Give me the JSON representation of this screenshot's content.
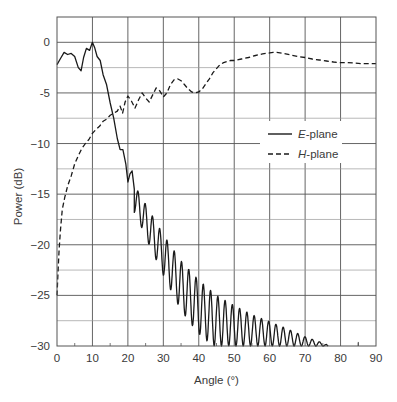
{
  "chart_data": {
    "type": "line",
    "title": "",
    "xlabel": "Angle (°)",
    "ylabel": "Power (dB)",
    "xlim": [
      0,
      90
    ],
    "ylim": [
      -30,
      2.5
    ],
    "x_ticks": [
      0,
      10,
      20,
      30,
      40,
      50,
      60,
      70,
      80,
      90
    ],
    "y_ticks": [
      0,
      -5,
      -10,
      -15,
      -20,
      -25,
      -30
    ],
    "y_tick_labels": [
      "0",
      "-5",
      "−10",
      "−15",
      "−20",
      "−25",
      "−30"
    ],
    "grid": true,
    "minor_grid_y": [
      2.5,
      -2.5,
      -7.5,
      -12.5,
      -17.5,
      -22.5,
      -27.5
    ],
    "legend": {
      "position": "right-middle",
      "entries": [
        {
          "label_italic": "E",
          "label_rest": "-plane",
          "style": "solid"
        },
        {
          "label_italic": "H",
          "label_rest": "-plane",
          "style": "dashed"
        }
      ]
    },
    "series": [
      {
        "name": "E-plane",
        "style": "solid",
        "color": "#1a1a1a",
        "main_lobe": [
          [
            0,
            -2.2
          ],
          [
            1,
            -1.6
          ],
          [
            2,
            -1.0
          ],
          [
            3,
            -1.2
          ],
          [
            4,
            -1.1
          ],
          [
            5,
            -1.4
          ],
          [
            6,
            -2.5
          ],
          [
            6.8,
            -2.8
          ],
          [
            7.5,
            -1.5
          ],
          [
            8.3,
            -0.6
          ],
          [
            9.2,
            -0.8
          ],
          [
            10,
            0.0
          ],
          [
            10.6,
            -0.5
          ],
          [
            11.3,
            -1.4
          ],
          [
            12.2,
            -1.8
          ],
          [
            13,
            -3.2
          ],
          [
            14,
            -4.2
          ],
          [
            15,
            -6.0
          ],
          [
            16,
            -7.5
          ],
          [
            17,
            -9.5
          ],
          [
            17.8,
            -10.6
          ],
          [
            18.6,
            -10.6
          ],
          [
            19.4,
            -12.0
          ],
          [
            20,
            -13.8
          ],
          [
            20.6,
            -13.0
          ],
          [
            21.2,
            -12.7
          ],
          [
            21.8,
            -14.5
          ]
        ],
        "sidelobe_ripple": {
          "start_angle": 21.8,
          "end_angle": 76,
          "period_deg": 2.05,
          "peak_envelope": [
            [
              22,
              -14.2
            ],
            [
              25,
              -16.0
            ],
            [
              30,
              -19.0
            ],
            [
              35,
              -21.6
            ],
            [
              40,
              -23.5
            ],
            [
              45,
              -25.0
            ],
            [
              50,
              -26.0
            ],
            [
              55,
              -26.9
            ],
            [
              60,
              -27.6
            ],
            [
              65,
              -28.3
            ],
            [
              70,
              -29.1
            ],
            [
              75,
              -29.7
            ],
            [
              76,
              -29.85
            ]
          ],
          "trough_envelope": [
            [
              22,
              -16.8
            ],
            [
              26,
              -20.0
            ],
            [
              30,
              -23.0
            ],
            [
              35,
              -26.5
            ],
            [
              40,
              -28.8
            ],
            [
              44,
              -30
            ],
            [
              90,
              -30
            ]
          ]
        }
      },
      {
        "name": "H-plane",
        "style": "dashed",
        "color": "#1a1a1a",
        "points": [
          [
            0,
            -25.0
          ],
          [
            0.3,
            -22.5
          ],
          [
            0.6,
            -20.5
          ],
          [
            1,
            -18.5
          ],
          [
            1.5,
            -16.5
          ],
          [
            2.2,
            -15.3
          ],
          [
            3,
            -14.2
          ],
          [
            4,
            -13.2
          ],
          [
            5,
            -12.0
          ],
          [
            6,
            -11.2
          ],
          [
            7,
            -10.5
          ],
          [
            8,
            -10.0
          ],
          [
            9,
            -9.6
          ],
          [
            10,
            -9.0
          ],
          [
            11,
            -8.6
          ],
          [
            12,
            -8.3
          ],
          [
            13,
            -7.8
          ],
          [
            14,
            -7.6
          ],
          [
            15,
            -7.2
          ],
          [
            16,
            -7.0
          ],
          [
            17,
            -6.8
          ],
          [
            17.8,
            -6.3
          ],
          [
            18.5,
            -7.0
          ],
          [
            19.2,
            -5.9
          ],
          [
            20,
            -5.3
          ],
          [
            21,
            -5.8
          ],
          [
            22,
            -6.5
          ],
          [
            23,
            -5.7
          ],
          [
            24,
            -5.0
          ],
          [
            25,
            -5.5
          ],
          [
            26,
            -5.9
          ],
          [
            27,
            -5.2
          ],
          [
            28,
            -4.5
          ],
          [
            29,
            -4.8
          ],
          [
            30,
            -5.4
          ],
          [
            31,
            -5.0
          ],
          [
            32,
            -4.2
          ],
          [
            33,
            -3.7
          ],
          [
            34,
            -3.6
          ],
          [
            35,
            -3.8
          ],
          [
            36,
            -4.2
          ],
          [
            37,
            -4.6
          ],
          [
            38,
            -4.9
          ],
          [
            39,
            -5.0
          ],
          [
            40,
            -4.9
          ],
          [
            41,
            -4.6
          ],
          [
            42,
            -4.1
          ],
          [
            43,
            -3.6
          ],
          [
            44,
            -3.0
          ],
          [
            45,
            -2.6
          ],
          [
            46,
            -2.2
          ],
          [
            47,
            -2.0
          ],
          [
            48,
            -1.9
          ],
          [
            49,
            -1.8
          ],
          [
            50,
            -1.8
          ],
          [
            52,
            -1.65
          ],
          [
            54,
            -1.5
          ],
          [
            56,
            -1.3
          ],
          [
            58,
            -1.15
          ],
          [
            60,
            -1.05
          ],
          [
            61,
            -1.0
          ],
          [
            62,
            -1.0
          ],
          [
            64,
            -1.1
          ],
          [
            66,
            -1.25
          ],
          [
            68,
            -1.4
          ],
          [
            70,
            -1.5
          ],
          [
            72,
            -1.65
          ],
          [
            74,
            -1.75
          ],
          [
            76,
            -1.85
          ],
          [
            78,
            -1.95
          ],
          [
            80,
            -2.0
          ],
          [
            82,
            -2.0
          ],
          [
            84,
            -2.05
          ],
          [
            86,
            -2.1
          ],
          [
            88,
            -2.1
          ],
          [
            90,
            -2.1
          ]
        ]
      }
    ]
  }
}
